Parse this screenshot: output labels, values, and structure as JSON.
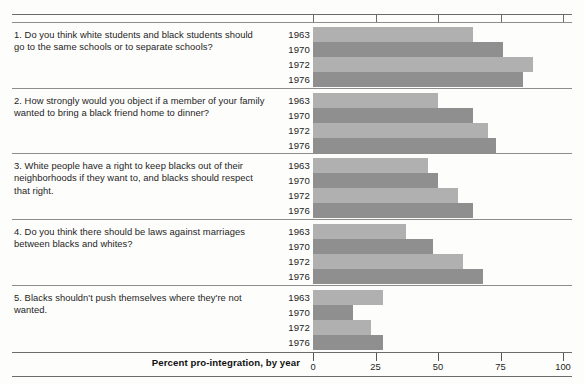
{
  "chart_data": {
    "type": "bar",
    "title": "",
    "xlabel": "Percent pro-integration, by year",
    "ylabel": "",
    "xlim": [
      0,
      100
    ],
    "ticks": [
      0,
      25,
      50,
      75,
      100
    ],
    "tick_labels": [
      "0",
      "25",
      "50",
      "75",
      "100"
    ],
    "grid": false,
    "legend": "none",
    "orientation": "horizontal",
    "categories": [
      "1963",
      "1970",
      "1972",
      "1976"
    ],
    "groups": [
      {
        "number": "1.",
        "question": "Do you think white students and black students should go to the same schools or to separate schools?",
        "years": [
          "1963",
          "1970",
          "1972",
          "1976"
        ],
        "values": [
          64,
          76,
          88,
          84
        ]
      },
      {
        "number": "2.",
        "question": "How strongly would you object if a member of your family wanted to bring a black friend home to dinner?",
        "years": [
          "1963",
          "1970",
          "1972",
          "1976"
        ],
        "values": [
          50,
          64,
          70,
          73
        ]
      },
      {
        "number": "3.",
        "question": "White people have a right to keep blacks out of their neighborhoods if they want to, and blacks should respect that right.",
        "years": [
          "1963",
          "1970",
          "1972",
          "1976"
        ],
        "values": [
          46,
          50,
          58,
          64
        ]
      },
      {
        "number": "4.",
        "question": "Do you think there should be laws against marriages between blacks and whites?",
        "years": [
          "1963",
          "1970",
          "1972",
          "1976"
        ],
        "values": [
          37,
          48,
          60,
          68
        ]
      },
      {
        "number": "5.",
        "question": "Blacks shouldn't push themselves where they're not wanted.",
        "years": [
          "1963",
          "1970",
          "1972",
          "1976"
        ],
        "values": [
          28,
          16,
          23,
          28
        ]
      }
    ],
    "colors": {
      "bar_light": "#b0b0b0",
      "bar_dark": "#8f8f8f",
      "rule": "#6b6b6b",
      "text": "#1d1d1d"
    }
  }
}
